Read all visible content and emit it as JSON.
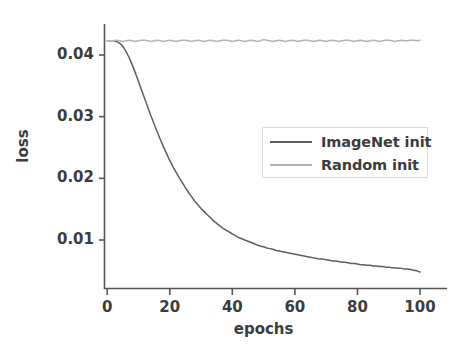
{
  "chart_data": {
    "type": "line",
    "title": "",
    "xlabel": "epochs",
    "ylabel": "loss",
    "xlim": [
      -3,
      104
    ],
    "ylim": [
      0.0035,
      0.0445
    ],
    "grid": false,
    "legend_position": "center-right",
    "xticks": [
      0,
      20,
      40,
      60,
      80,
      100
    ],
    "xtick_labels": [
      "0",
      "20",
      "40",
      "60",
      "80",
      "100"
    ],
    "yticks": [
      0.01,
      0.02,
      0.03,
      0.04
    ],
    "ytick_labels": [
      "0.01",
      "0.02",
      "0.03",
      "0.04"
    ],
    "colors": {
      "imagenet_init": "#5e5e5e",
      "random_init": "#b4b4b4",
      "axis": "#555555",
      "text": "#3c3c3c",
      "background": "#ffffff",
      "legend_border": "#d8d8d8"
    },
    "x": [
      0,
      1,
      2,
      3,
      4,
      5,
      6,
      7,
      8,
      9,
      10,
      11,
      12,
      13,
      14,
      15,
      16,
      17,
      18,
      19,
      20,
      21,
      22,
      23,
      24,
      25,
      26,
      27,
      28,
      29,
      30,
      31,
      32,
      33,
      34,
      35,
      36,
      37,
      38,
      39,
      40,
      41,
      42,
      43,
      44,
      45,
      46,
      47,
      48,
      49,
      50,
      51,
      52,
      53,
      54,
      55,
      56,
      57,
      58,
      59,
      60,
      61,
      62,
      63,
      64,
      65,
      66,
      67,
      68,
      69,
      70,
      71,
      72,
      73,
      74,
      75,
      76,
      77,
      78,
      79,
      80,
      81,
      82,
      83,
      84,
      85,
      86,
      87,
      88,
      89,
      90,
      91,
      92,
      93,
      94,
      95,
      96,
      97,
      98,
      99,
      100
    ],
    "series": [
      {
        "name": "ImageNet init",
        "color": "#5e5e5e",
        "values": [
          0.0423,
          0.0423,
          0.0423,
          0.0422,
          0.0419,
          0.0414,
          0.0406,
          0.0396,
          0.0384,
          0.0371,
          0.0357,
          0.0343,
          0.0329,
          0.0315,
          0.0301,
          0.0288,
          0.0275,
          0.0263,
          0.0251,
          0.024,
          0.0229,
          0.0219,
          0.021,
          0.0201,
          0.0193,
          0.0185,
          0.0177,
          0.017,
          0.0163,
          0.0157,
          0.0151,
          0.0146,
          0.0141,
          0.0136,
          0.0131,
          0.0127,
          0.0123,
          0.0119,
          0.0116,
          0.0113,
          0.011,
          0.0107,
          0.0104,
          0.0102,
          0.01,
          0.0098,
          0.0096,
          0.0094,
          0.0092,
          0.009,
          0.0089,
          0.0087,
          0.0086,
          0.0085,
          0.0083,
          0.0082,
          0.0081,
          0.008,
          0.0079,
          0.0078,
          0.0077,
          0.0076,
          0.0075,
          0.0074,
          0.0073,
          0.0072,
          0.0071,
          0.007,
          0.0069,
          0.0069,
          0.0068,
          0.0067,
          0.0066,
          0.0066,
          0.0065,
          0.0064,
          0.0064,
          0.0063,
          0.0062,
          0.0062,
          0.0061,
          0.006,
          0.006,
          0.0059,
          0.0059,
          0.0058,
          0.0058,
          0.0057,
          0.0057,
          0.0056,
          0.0056,
          0.0055,
          0.0055,
          0.0054,
          0.0054,
          0.0053,
          0.0053,
          0.0052,
          0.0051,
          0.005,
          0.0048
        ]
      },
      {
        "name": "Random init",
        "color": "#b4b4b4",
        "values": [
          0.0423,
          0.0423,
          0.0423,
          0.0424,
          0.0423,
          0.0422,
          0.0423,
          0.0424,
          0.0423,
          0.0422,
          0.0423,
          0.0424,
          0.0424,
          0.0423,
          0.0422,
          0.0423,
          0.0424,
          0.0423,
          0.0422,
          0.0423,
          0.0424,
          0.0423,
          0.0422,
          0.0423,
          0.0424,
          0.0424,
          0.0423,
          0.0422,
          0.0423,
          0.0424,
          0.0423,
          0.0422,
          0.0423,
          0.0424,
          0.0423,
          0.0422,
          0.0423,
          0.0424,
          0.0424,
          0.0423,
          0.0422,
          0.0423,
          0.0424,
          0.0423,
          0.0422,
          0.0423,
          0.0424,
          0.0423,
          0.0422,
          0.0423,
          0.0425,
          0.0424,
          0.0423,
          0.0422,
          0.0423,
          0.0424,
          0.0423,
          0.0422,
          0.0423,
          0.0424,
          0.0423,
          0.0422,
          0.0423,
          0.0424,
          0.0424,
          0.0423,
          0.0422,
          0.0423,
          0.0424,
          0.0423,
          0.0422,
          0.0423,
          0.0424,
          0.0423,
          0.0422,
          0.0423,
          0.0424,
          0.0424,
          0.0423,
          0.0422,
          0.0423,
          0.0424,
          0.0423,
          0.0422,
          0.0423,
          0.0424,
          0.0423,
          0.0422,
          0.0423,
          0.0424,
          0.0424,
          0.0423,
          0.0422,
          0.0423,
          0.0424,
          0.0423,
          0.0423,
          0.0424,
          0.0424,
          0.0423,
          0.0424
        ]
      }
    ],
    "legend": [
      {
        "label": "ImageNet init",
        "color": "#5e5e5e"
      },
      {
        "label": "Random init",
        "color": "#b4b4b4"
      }
    ]
  }
}
